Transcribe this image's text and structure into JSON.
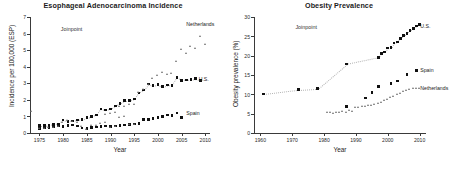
{
  "figure": {
    "panels": [
      "esophageal",
      "obesity"
    ]
  },
  "chart_data": [
    {
      "type": "scatter",
      "id": "esophageal",
      "title": "Esophageal Adenocarcinoma Incidence",
      "xlabel": "Year",
      "ylabel": "Incidence per 100,000 (ESP)",
      "xlim": [
        1973,
        2011
      ],
      "ylim": [
        0,
        7
      ],
      "xticks": [
        1975,
        1980,
        1985,
        1990,
        1995,
        2000,
        2005,
        2010
      ],
      "yticks": [
        0,
        1,
        2,
        3,
        4,
        5,
        6,
        7
      ],
      "grid": false,
      "legend_position": "inline-annotations",
      "annotations": [
        {
          "text": "Joinpoint",
          "x": 1979.5,
          "y": 6.3
        },
        {
          "text": "Netherlands",
          "x": 2006.0,
          "y": 6.55
        },
        {
          "text": "U.S.",
          "x": 2008.6,
          "y": 3.25
        },
        {
          "text": "Spain",
          "x": 2006.0,
          "y": 1.22
        }
      ],
      "series": [
        {
          "name": "U.S.",
          "marker": "filled-square",
          "color": "#101010",
          "points": [
            [
              1975,
              0.45
            ],
            [
              1976,
              0.45
            ],
            [
              1977,
              0.48
            ],
            [
              1978,
              0.52
            ],
            [
              1979,
              0.55
            ],
            [
              1980,
              0.78
            ],
            [
              1981,
              0.7
            ],
            [
              1982,
              0.72
            ],
            [
              1983,
              0.78
            ],
            [
              1984,
              0.8
            ],
            [
              1985,
              0.92
            ],
            [
              1986,
              1.0
            ],
            [
              1987,
              1.08
            ],
            [
              1988,
              1.45
            ],
            [
              1989,
              1.38
            ],
            [
              1990,
              1.45
            ],
            [
              1991,
              1.62
            ],
            [
              1992,
              1.78
            ],
            [
              1993,
              1.95
            ],
            [
              1994,
              1.95
            ],
            [
              1995,
              2.05
            ],
            [
              1996,
              2.42
            ],
            [
              1997,
              2.6
            ],
            [
              1998,
              2.95
            ],
            [
              1999,
              2.85
            ],
            [
              2000,
              2.92
            ],
            [
              2001,
              2.8
            ],
            [
              2002,
              2.9
            ],
            [
              2003,
              2.88
            ],
            [
              2004,
              3.35
            ],
            [
              2005,
              3.18
            ],
            [
              2006,
              3.2
            ],
            [
              2007,
              3.22
            ],
            [
              2008,
              3.28
            ],
            [
              2009,
              3.18
            ]
          ]
        },
        {
          "name": "Netherlands",
          "marker": "open-triangle",
          "color": "#6d6d6d",
          "points": [
            [
              1989,
              1.12
            ],
            [
              1990,
              1.15
            ],
            [
              1991,
              1.22
            ],
            [
              1992,
              1.58
            ],
            [
              1993,
              1.6
            ],
            [
              1994,
              1.72
            ],
            [
              1995,
              1.68
            ],
            [
              1996,
              2.42
            ],
            [
              1997,
              2.58
            ],
            [
              1998,
              2.92
            ],
            [
              1999,
              3.25
            ],
            [
              2000,
              3.42
            ],
            [
              2001,
              3.62
            ],
            [
              2002,
              3.48
            ],
            [
              2003,
              3.58
            ],
            [
              2004,
              4.28
            ],
            [
              2005,
              5.02
            ],
            [
              2006,
              4.8
            ],
            [
              2007,
              5.18
            ],
            [
              2008,
              5.08
            ],
            [
              2009,
              5.78
            ],
            [
              2010,
              5.32
            ]
          ]
        },
        {
          "name": "Spain",
          "marker": "filled-square",
          "color": "#101010",
          "points": [
            [
              1975,
              0.28
            ],
            [
              1976,
              0.3
            ],
            [
              1977,
              0.32
            ],
            [
              1978,
              0.35
            ],
            [
              1979,
              0.42
            ],
            [
              1980,
              0.4
            ],
            [
              1981,
              0.45
            ],
            [
              1982,
              0.48
            ],
            [
              1983,
              0.42
            ],
            [
              1984,
              0.3
            ],
            [
              1985,
              0.28
            ],
            [
              1986,
              0.32
            ],
            [
              1987,
              0.35
            ],
            [
              1988,
              0.38
            ],
            [
              1989,
              0.42
            ],
            [
              1990,
              0.4
            ],
            [
              1991,
              0.42
            ],
            [
              1992,
              0.45
            ],
            [
              1993,
              0.48
            ],
            [
              1994,
              0.52
            ],
            [
              1995,
              0.55
            ],
            [
              1996,
              0.58
            ],
            [
              1997,
              0.8
            ],
            [
              1998,
              0.82
            ],
            [
              1999,
              0.88
            ],
            [
              2000,
              0.92
            ],
            [
              2001,
              0.98
            ],
            [
              2002,
              1.08
            ],
            [
              2003,
              1.05
            ],
            [
              2004,
              1.2
            ],
            [
              2005,
              0.92
            ]
          ]
        },
        {
          "name": "Netherlands-early",
          "marker": "open-triangle",
          "color": "#6d6d6d",
          "points": [
            [
              1975,
              0.22
            ],
            [
              1976,
              0.25
            ],
            [
              1977,
              0.28
            ],
            [
              1978,
              0.3
            ],
            [
              1979,
              0.35
            ],
            [
              1980,
              0.6
            ],
            [
              1981,
              0.72
            ],
            [
              1982,
              0.7
            ],
            [
              1983,
              0.62
            ],
            [
              1984,
              0.38
            ],
            [
              1985,
              0.2
            ],
            [
              1986,
              0.42
            ],
            [
              1987,
              0.45
            ],
            [
              1988,
              0.55
            ],
            [
              1989,
              0.6
            ],
            [
              1990,
              0.3
            ],
            [
              1991,
              0.35
            ],
            [
              1992,
              0.92
            ],
            [
              1993,
              0.98
            ],
            [
              1994,
              0.5
            ],
            [
              1995,
              0.48
            ]
          ]
        },
        {
          "name": "Joinpoint-anchor",
          "marker": "open-triangle",
          "color": "#6d6d6d",
          "points": [
            [
              1973.4,
              1.25
            ]
          ]
        }
      ]
    },
    {
      "type": "scatter",
      "id": "obesity",
      "title": "Obesity Prevalence",
      "xlabel": "Year",
      "ylabel": "Obesity prevalence (%)",
      "xlim": [
        1958,
        2012
      ],
      "ylim": [
        0,
        30
      ],
      "xticks": [
        1960,
        1970,
        1980,
        1990,
        2000,
        2010
      ],
      "yticks": [
        0,
        5,
        10,
        15,
        20,
        25,
        30
      ],
      "grid": false,
      "legend_position": "inline-annotations",
      "annotations": [
        {
          "text": "Joinpoint",
          "x": 1971.0,
          "y": 27.4
        },
        {
          "text": "U.S.",
          "x": 2010.2,
          "y": 27.6
        },
        {
          "text": "Spain",
          "x": 2010.2,
          "y": 16.3
        },
        {
          "text": "Netherlands",
          "x": 2010.2,
          "y": 11.6
        }
      ],
      "series": [
        {
          "name": "U.S.",
          "marker": "filled-square",
          "color": "#101010",
          "points": [
            [
              1961,
              10.1
            ],
            [
              1972,
              11.2
            ],
            [
              1978,
              11.5
            ],
            [
              1987,
              17.8
            ],
            [
              1997,
              19.5
            ],
            [
              1998,
              20.6
            ],
            [
              1999,
              20.9
            ],
            [
              2000,
              22.0
            ],
            [
              2001,
              22.1
            ],
            [
              2002,
              23.3
            ],
            [
              2003,
              23.5
            ],
            [
              2004,
              24.5
            ],
            [
              2005,
              25.2
            ],
            [
              2006,
              25.8
            ],
            [
              2007,
              26.5
            ],
            [
              2008,
              27.0
            ],
            [
              2009,
              27.7
            ],
            [
              2010,
              28.0
            ]
          ]
        },
        {
          "name": "Spain",
          "marker": "filled-square",
          "color": "#101010",
          "points": [
            [
              1987,
              6.8
            ],
            [
              1993,
              9.0
            ],
            [
              1995,
              10.5
            ],
            [
              1997,
              12.0
            ],
            [
              2001,
              12.8
            ],
            [
              2003,
              13.4
            ],
            [
              2006,
              15.2
            ],
            [
              2009,
              16.1
            ]
          ]
        },
        {
          "name": "Netherlands",
          "marker": "open-triangle",
          "color": "#6d6d6d",
          "points": [
            [
              1981,
              5.1
            ],
            [
              1982,
              5.2
            ],
            [
              1983,
              5.0
            ],
            [
              1984,
              5.3
            ],
            [
              1985,
              5.2
            ],
            [
              1986,
              5.4
            ],
            [
              1987,
              5.3
            ],
            [
              1988,
              5.6
            ],
            [
              1989,
              5.5
            ],
            [
              1990,
              6.6
            ],
            [
              1991,
              6.5
            ],
            [
              1992,
              6.8
            ],
            [
              1993,
              6.7
            ],
            [
              1994,
              7.0
            ],
            [
              1995,
              7.1
            ],
            [
              1996,
              7.3
            ],
            [
              1997,
              7.5
            ],
            [
              1998,
              7.8
            ],
            [
              1999,
              8.2
            ],
            [
              2000,
              8.6
            ],
            [
              2001,
              9.0
            ],
            [
              2002,
              9.4
            ],
            [
              2003,
              9.8
            ],
            [
              2004,
              10.2
            ],
            [
              2005,
              10.6
            ],
            [
              2006,
              11.0
            ],
            [
              2007,
              11.2
            ],
            [
              2008,
              11.4
            ],
            [
              2009,
              11.5
            ],
            [
              2010,
              11.3
            ]
          ]
        }
      ]
    }
  ]
}
